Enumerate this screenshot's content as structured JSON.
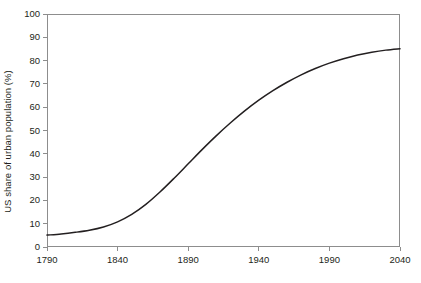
{
  "chart_data": {
    "type": "line",
    "title": "",
    "subtitle": "",
    "xlabel": "",
    "ylabel": "US share of urban population (%)",
    "xlim": [
      1790,
      2040
    ],
    "ylim": [
      0,
      100
    ],
    "grid": false,
    "legend": false,
    "legend_position": "none",
    "line_color": "#231f20",
    "axis_color": "#8d8d8d",
    "x_ticks": [
      1790,
      1840,
      1890,
      1940,
      1990,
      2040
    ],
    "x_tick_labels": [
      "1790",
      "1840",
      "1890",
      "1940",
      "1990",
      "2040"
    ],
    "y_ticks": [
      0,
      10,
      20,
      30,
      40,
      50,
      60,
      70,
      80,
      90,
      100
    ],
    "y_tick_labels": [
      "0",
      "10",
      "20",
      "30",
      "40",
      "50",
      "60",
      "70",
      "80",
      "90",
      "100"
    ],
    "series": [
      {
        "name": "US share of urban population",
        "x": [
          1790,
          1800,
          1810,
          1820,
          1830,
          1840,
          1850,
          1860,
          1870,
          1880,
          1890,
          1900,
          1910,
          1920,
          1930,
          1940,
          1950,
          1960,
          1970,
          1980,
          1990,
          2000,
          2010,
          2020,
          2030,
          2040
        ],
        "values": [
          5.1,
          5.6,
          6.3,
          7.2,
          8.6,
          10.8,
          14.0,
          18.3,
          23.6,
          29.5,
          35.7,
          41.9,
          47.8,
          53.3,
          58.4,
          63.0,
          67.1,
          70.7,
          73.9,
          76.6,
          78.9,
          80.8,
          82.4,
          83.6,
          84.5,
          85.1
        ]
      }
    ]
  }
}
